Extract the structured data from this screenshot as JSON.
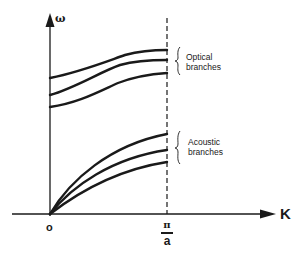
{
  "diagram": {
    "type": "phonon-dispersion",
    "axes": {
      "y_label": "ω",
      "x_label": "K",
      "origin_label": "o",
      "boundary_label": {
        "numerator": "π",
        "denominator": "a"
      }
    },
    "groups": [
      {
        "name": "optical",
        "label_line1": "Optical",
        "label_line2": "branches",
        "curve_count": 3
      },
      {
        "name": "acoustic",
        "label_line1": "Acoustic",
        "label_line2": "branches",
        "curve_count": 3
      }
    ],
    "colors": {
      "ink": "#1a1a1a",
      "background": "#ffffff"
    }
  }
}
